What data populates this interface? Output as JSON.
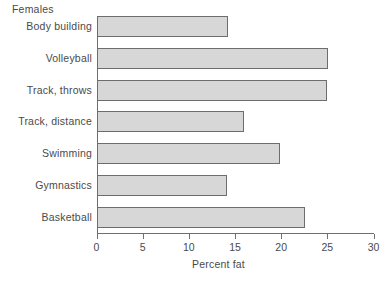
{
  "caption": "Females",
  "chart_data": {
    "type": "bar",
    "orientation": "horizontal",
    "title": "Females",
    "xlabel": "Percent fat",
    "ylabel": "",
    "xlim": [
      0,
      30
    ],
    "xticks": [
      0,
      5,
      10,
      15,
      20,
      25,
      30
    ],
    "xtick_labels": [
      "0",
      "5",
      "10",
      "15",
      "20",
      "25",
      "30"
    ],
    "grid": false,
    "legend": false,
    "bar_fill_color": "#d7d7d7",
    "bar_edge_color": "#6d6d6d",
    "axis_color": "#6f6f6f",
    "text_color": "#4a4a4a",
    "categories": [
      "Body building",
      "Volleyball",
      "Track, throws",
      "Track, distance",
      "Swimming",
      "Gymnastics",
      "Basketball"
    ],
    "values": [
      14.2,
      25.1,
      25.0,
      16.0,
      19.9,
      14.1,
      22.6
    ]
  }
}
